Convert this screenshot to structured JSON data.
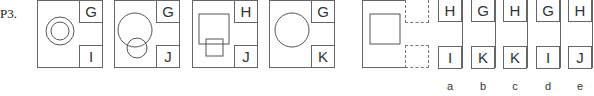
{
  "question": {
    "label": "P3."
  },
  "panels": [
    {
      "figure": "concentric-circles",
      "top_letter": "G",
      "bottom_letter": "I"
    },
    {
      "figure": "overlapping-circles",
      "top_letter": "G",
      "bottom_letter": "J"
    },
    {
      "figure": "overlapping-squares",
      "top_letter": "H",
      "bottom_letter": "J"
    },
    {
      "figure": "single-circle",
      "top_letter": "G",
      "bottom_letter": "K"
    },
    {
      "figure": "single-square",
      "top_letter": "",
      "bottom_letter": "",
      "missing": true
    }
  ],
  "options": [
    {
      "label": "a",
      "top": "H",
      "bottom": "I"
    },
    {
      "label": "b",
      "top": "G",
      "bottom": "K"
    },
    {
      "label": "c",
      "top": "H",
      "bottom": "K"
    },
    {
      "label": "d",
      "top": "G",
      "bottom": "I"
    },
    {
      "label": "e",
      "top": "H",
      "bottom": "J"
    }
  ]
}
